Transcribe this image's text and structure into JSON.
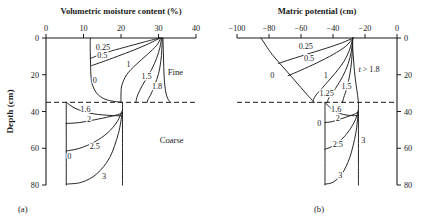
{
  "figure": {
    "caption_a": "(a)",
    "caption_b": "(b)",
    "ylabel": "Depth (cm)",
    "zone_fine": "Fine",
    "zone_coarse": "Coarse"
  },
  "chart_data": [
    {
      "type": "line",
      "panel": "a",
      "title": "Volumetric moisture content (%)",
      "xlabel": "Volumetric moisture content (%)",
      "ylabel": "Depth (cm)",
      "xlim": [
        0,
        40
      ],
      "ylim": [
        80,
        0
      ],
      "xticks": [
        0,
        10,
        20,
        30,
        40
      ],
      "xtick_labels": [
        "0",
        "10",
        "20",
        "30",
        "40"
      ],
      "yticks": [
        0,
        20,
        40,
        60,
        80
      ],
      "ytick_labels": [
        "0",
        "20",
        "40",
        "60",
        "80"
      ],
      "grid": false,
      "legend": "none",
      "axis_position": {
        "x": "top",
        "y": "left"
      },
      "interface_depth": 35,
      "interface_style": "dashed",
      "annotations": [
        {
          "text": "Fine",
          "x": 34.5,
          "y": 20
        },
        {
          "text": "Coarse",
          "x": 33.5,
          "y": 57
        }
      ],
      "series": [
        {
          "name": "0.25",
          "label": "0.25",
          "label_x": 15.2,
          "label_y": 6.5,
          "points": [
            [
              30.3,
              0
            ],
            [
              26.5,
              2.0
            ],
            [
              22.0,
              4.5
            ],
            [
              17.5,
              7.0
            ],
            [
              14.2,
              9.2
            ],
            [
              12.0,
              11.0
            ]
          ]
        },
        {
          "name": "0.5",
          "label": "0.5",
          "label_x": 15.0,
          "label_y": 11.0,
          "points": [
            [
              30.4,
              0
            ],
            [
              27.5,
              3.0
            ],
            [
              23.5,
              6.5
            ],
            [
              19.0,
              10.0
            ],
            [
              15.0,
              13.0
            ],
            [
              12.2,
              15.0
            ]
          ]
        },
        {
          "name": "0",
          "label": "0",
          "label_x": 13.0,
          "label_y": 24.5,
          "points": [
            [
              11.8,
              0
            ],
            [
              11.8,
              8
            ],
            [
              11.9,
              16
            ],
            [
              12.2,
              24
            ],
            [
              13.5,
              30
            ],
            [
              16.0,
              33.5
            ],
            [
              20.0,
              35
            ]
          ]
        },
        {
          "name": "1",
          "label": "1",
          "label_x": 22.0,
          "label_y": 16.0,
          "points": [
            [
              30.6,
              0
            ],
            [
              29.5,
              4.0
            ],
            [
              27.0,
              9.0
            ],
            [
              24.0,
              14.5
            ],
            [
              21.5,
              20.0
            ],
            [
              20.2,
              26.0
            ],
            [
              20.0,
              31.0
            ],
            [
              20.0,
              35
            ]
          ]
        },
        {
          "name": "1.5",
          "label": "1.5",
          "label_x": 26.8,
          "label_y": 22.5,
          "points": [
            [
              30.8,
              0
            ],
            [
              30.4,
              5.0
            ],
            [
              29.5,
              11.0
            ],
            [
              28.2,
              17.0
            ],
            [
              26.5,
              23.0
            ],
            [
              25.0,
              28.5
            ],
            [
              24.2,
              32.5
            ],
            [
              24.0,
              35
            ]
          ]
        },
        {
          "name": "1.8",
          "label": "1.8",
          "label_x": 29.6,
          "label_y": 27.5,
          "points": [
            [
              31.0,
              0
            ],
            [
              30.9,
              6.0
            ],
            [
              30.6,
              13.0
            ],
            [
              30.0,
              19.5
            ],
            [
              29.0,
              25.5
            ],
            [
              28.0,
              30.5
            ],
            [
              27.2,
              33.5
            ],
            [
              27.0,
              35
            ]
          ]
        },
        {
          "name": "saturated-front",
          "label": "",
          "label_x": 0,
          "label_y": 0,
          "points": [
            [
              31.2,
              0
            ],
            [
              31.3,
              8
            ],
            [
              31.4,
              16
            ],
            [
              31.6,
              24
            ],
            [
              32.0,
              30
            ],
            [
              32.6,
              33.5
            ],
            [
              33.2,
              35
            ]
          ]
        },
        {
          "name": "coarse-0",
          "label": "0",
          "label_x": 6.2,
          "label_y": 66.0,
          "points": [
            [
              5.4,
              35
            ],
            [
              5.4,
              45
            ],
            [
              5.4,
              55
            ],
            [
              5.4,
              65
            ],
            [
              5.4,
              75
            ],
            [
              5.4,
              80
            ]
          ]
        },
        {
          "name": "coarse-1.6",
          "label": "1.6",
          "label_x": 10.5,
          "label_y": 40.5,
          "points": [
            [
              5.4,
              35
            ],
            [
              8.0,
              38.5
            ],
            [
              12.0,
              41.0
            ],
            [
              16.0,
              42.0
            ],
            [
              19.0,
              42.3
            ],
            [
              20.3,
              42.3
            ]
          ]
        },
        {
          "name": "coarse-2",
          "label": "2",
          "label_x": 11.5,
          "label_y": 45.5,
          "points": [
            [
              5.4,
              46.5
            ],
            [
              9.0,
              46.0
            ],
            [
              13.0,
              44.5
            ],
            [
              17.0,
              42.8
            ],
            [
              19.5,
              41.5
            ],
            [
              20.4,
              40.5
            ]
          ]
        },
        {
          "name": "coarse-2.5",
          "label": "2.5",
          "label_x": 13.0,
          "label_y": 60.5,
          "points": [
            [
              5.4,
              61.5
            ],
            [
              9.0,
              60.0
            ],
            [
              13.0,
              56.5
            ],
            [
              16.5,
              51.5
            ],
            [
              19.0,
              45.5
            ],
            [
              20.2,
              40.0
            ]
          ]
        },
        {
          "name": "coarse-3",
          "label": "3",
          "label_x": 15.5,
          "label_y": 76.5,
          "points": [
            [
              5.4,
              79.5
            ],
            [
              9.5,
              78.5
            ],
            [
              13.5,
              74.0
            ],
            [
              17.0,
              65.0
            ],
            [
              19.3,
              52.0
            ],
            [
              20.3,
              41.0
            ]
          ]
        },
        {
          "name": "coarse-right-edge",
          "label": "",
          "label_x": 0,
          "label_y": 0,
          "points": [
            [
              20.4,
              35
            ],
            [
              20.4,
              42
            ],
            [
              20.4,
              50
            ],
            [
              20.4,
              60
            ],
            [
              20.4,
              70
            ],
            [
              20.4,
              80
            ]
          ]
        }
      ]
    },
    {
      "type": "line",
      "panel": "b",
      "title": "Matric potential (cm)",
      "xlabel": "Matric potential (cm)",
      "ylabel": "Depth (cm)",
      "xlim": [
        -100,
        0
      ],
      "ylim": [
        80,
        0
      ],
      "xticks": [
        -100,
        -80,
        -60,
        -40,
        -20,
        0
      ],
      "xtick_labels": [
        "−100",
        "−80",
        "−60",
        "−40",
        "−20",
        "0"
      ],
      "yticks": [
        0,
        20,
        40,
        60,
        80
      ],
      "ytick_labels": [
        "0",
        "20",
        "40",
        "60",
        "80"
      ],
      "grid": false,
      "legend": "none",
      "axis_position": {
        "x": "top",
        "y": "right"
      },
      "interface_depth": 35,
      "interface_style": "dashed",
      "annotations": [
        {
          "text": "t > 1.8",
          "x": -17.5,
          "y": 18.5,
          "italic_first": true
        }
      ],
      "series": [
        {
          "name": "0",
          "label": "0",
          "label_x": -78.0,
          "label_y": 21.5,
          "points": [
            [
              -85.0,
              0
            ],
            [
              -78.0,
              9.0
            ],
            [
              -70.0,
              17.0
            ],
            [
              -62.0,
              25.0
            ],
            [
              -55.0,
              32.0
            ],
            [
              -51.5,
              35
            ]
          ]
        },
        {
          "name": "0.25",
          "label": "0.25",
          "label_x": -57.0,
          "label_y": 6.0,
          "points": [
            [
              -27.5,
              0
            ],
            [
              -34.0,
              2.5
            ],
            [
              -44.0,
              5.5
            ],
            [
              -55.0,
              8.5
            ],
            [
              -66.0,
              11.5
            ],
            [
              -74.0,
              13.8
            ]
          ]
        },
        {
          "name": "0.5",
          "label": "0.5",
          "label_x": -55.0,
          "label_y": 12.5,
          "points": [
            [
              -27.5,
              0
            ],
            [
              -32.0,
              4.5
            ],
            [
              -40.0,
              9.0
            ],
            [
              -50.0,
              13.5
            ],
            [
              -60.0,
              17.5
            ],
            [
              -68.0,
              20.5
            ]
          ]
        },
        {
          "name": "1",
          "label": "1",
          "label_x": -44.5,
          "label_y": 22.0,
          "points": [
            [
              -27.6,
              0
            ],
            [
              -29.5,
              6.0
            ],
            [
              -33.0,
              12.5
            ],
            [
              -38.5,
              19.0
            ],
            [
              -45.0,
              25.5
            ],
            [
              -51.0,
              31.5
            ],
            [
              -52.5,
              34.5
            ]
          ]
        },
        {
          "name": "1.25",
          "label": "1.25",
          "label_x": -44.0,
          "label_y": 31.5,
          "points": [
            [
              -27.6,
              0
            ],
            [
              -28.5,
              7.0
            ],
            [
              -30.5,
              14.0
            ],
            [
              -34.0,
              21.0
            ],
            [
              -38.5,
              27.5
            ],
            [
              -42.5,
              32.5
            ],
            [
              -43.5,
              35
            ]
          ]
        },
        {
          "name": "1.5",
          "label": "1.5",
          "label_x": -31.5,
          "label_y": 27.5,
          "points": [
            [
              -27.7,
              0
            ],
            [
              -28.0,
              8.0
            ],
            [
              -28.8,
              16.0
            ],
            [
              -30.2,
              23.0
            ],
            [
              -32.0,
              29.0
            ],
            [
              -33.5,
              33.0
            ],
            [
              -34.0,
              35
            ]
          ]
        },
        {
          "name": "t-gt-1.8",
          "label": "",
          "label_x": 0,
          "label_y": 0,
          "points": [
            [
              -27.8,
              0
            ],
            [
              -27.5,
              8.0
            ],
            [
              -26.8,
              16.0
            ],
            [
              -25.8,
              24.0
            ],
            [
              -24.8,
              30.0
            ],
            [
              -24.2,
              34.0
            ],
            [
              -24.0,
              35
            ]
          ]
        },
        {
          "name": "coarse-0",
          "label": "0",
          "label_x": -48.5,
          "label_y": 48.0,
          "points": [
            [
              -45.0,
              35
            ],
            [
              -45.0,
              45
            ],
            [
              -45.0,
              55
            ],
            [
              -45.0,
              65
            ],
            [
              -45.0,
              75
            ],
            [
              -45.0,
              80
            ]
          ]
        },
        {
          "name": "coarse-1.6",
          "label": "1.6",
          "label_x": -38.0,
          "label_y": 40.0,
          "points": [
            [
              -45.0,
              35
            ],
            [
              -41.0,
              38.5
            ],
            [
              -36.0,
              41.0
            ],
            [
              -31.0,
              42.0
            ],
            [
              -26.5,
              42.3
            ],
            [
              -24.2,
              42.2
            ]
          ]
        },
        {
          "name": "coarse-2",
          "label": "2",
          "label_x": -37.0,
          "label_y": 45.0,
          "points": [
            [
              -45.0,
              46.0
            ],
            [
              -40.5,
              45.5
            ],
            [
              -35.0,
              44.0
            ],
            [
              -30.0,
              42.5
            ],
            [
              -26.0,
              41.2
            ],
            [
              -24.2,
              40.2
            ]
          ]
        },
        {
          "name": "coarse-2.5",
          "label": "2.5",
          "label_x": -37.0,
          "label_y": 59.5,
          "points": [
            [
              -45.0,
              60.5
            ],
            [
              -40.5,
              59.0
            ],
            [
              -35.0,
              55.5
            ],
            [
              -30.0,
              50.5
            ],
            [
              -26.0,
              44.5
            ],
            [
              -24.3,
              39.5
            ]
          ]
        },
        {
          "name": "coarse-3-bottom",
          "label": "3",
          "label_x": -35.5,
          "label_y": 76.0,
          "points": [
            [
              -45.0,
              79.5
            ],
            [
              -40.0,
              78.5
            ],
            [
              -34.5,
              74.0
            ],
            [
              -29.5,
              65.0
            ],
            [
              -25.8,
              52.0
            ],
            [
              -24.3,
              41.0
            ]
          ]
        },
        {
          "name": "coarse-3-right",
          "label": "3",
          "label_x": -21.0,
          "label_y": 57.0,
          "points": [
            [
              -24.1,
              35
            ],
            [
              -24.1,
              42
            ],
            [
              -24.1,
              50
            ],
            [
              -24.1,
              60
            ],
            [
              -24.1,
              70
            ],
            [
              -24.1,
              80
            ]
          ]
        }
      ]
    }
  ]
}
